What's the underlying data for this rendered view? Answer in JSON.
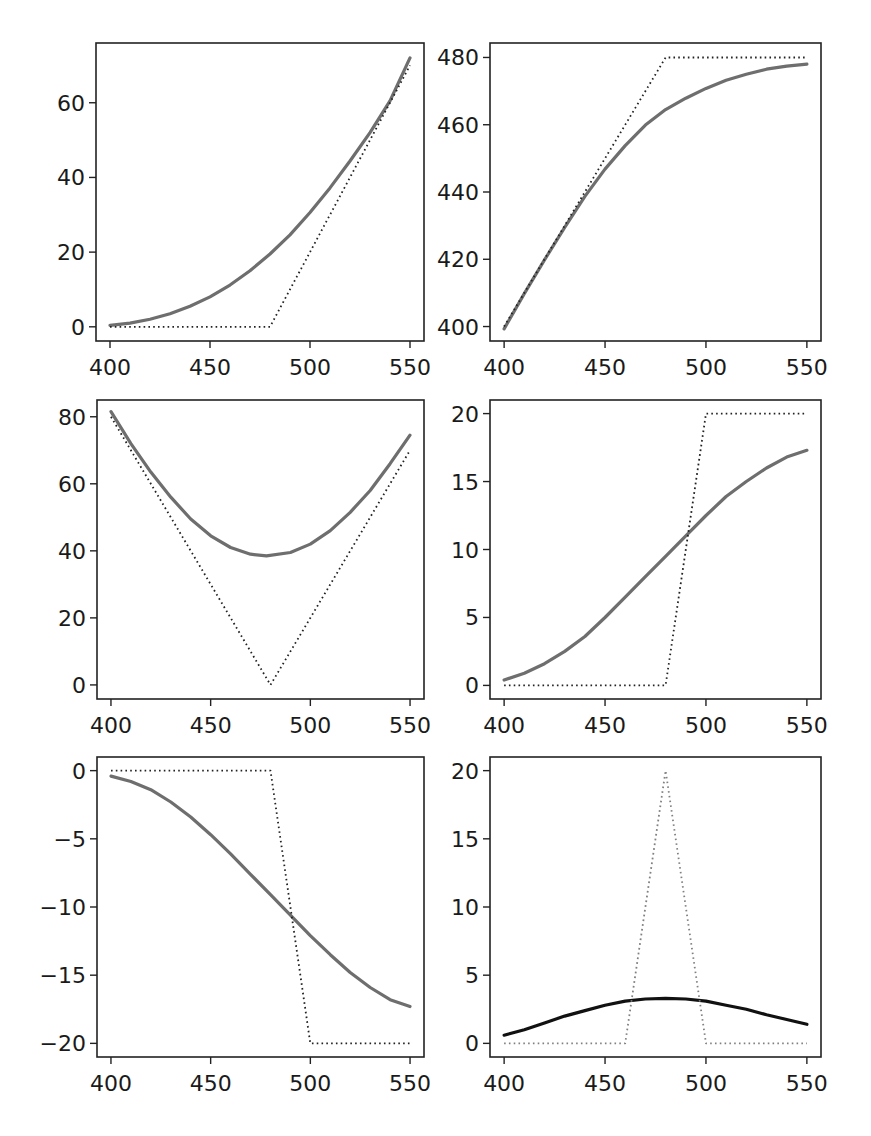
{
  "figure": {
    "layout": "3 rows x 2 columns grid of line plots",
    "colors": {
      "solid_gray": "#6e6e6e",
      "solid_black": "#111111",
      "dotted_black": "#222222",
      "dotted_gray": "#808080",
      "frame": "#222222",
      "background": "#ffffff"
    }
  },
  "chart_data": [
    {
      "id": "panel-1",
      "type": "line",
      "title": "",
      "xlabel": "",
      "ylabel": "",
      "xlim": [
        393,
        557
      ],
      "ylim": [
        -3.8,
        76
      ],
      "xticks": [
        400,
        450,
        500,
        550
      ],
      "xtick_labels": [
        "400",
        "450",
        "500",
        "550"
      ],
      "yticks": [
        0,
        20,
        40,
        60
      ],
      "ytick_labels": [
        "0",
        "20",
        "40",
        "60"
      ],
      "grid": false,
      "box": {
        "left": 96,
        "top": 43,
        "right": 424,
        "bottom": 341
      },
      "series": [
        {
          "name": "smoothed",
          "style": "solid",
          "color": "#6e6e6e",
          "width": 3.2,
          "x": [
            400,
            410,
            420,
            430,
            440,
            450,
            460,
            470,
            480,
            490,
            500,
            510,
            520,
            530,
            540,
            550
          ],
          "y": [
            0.4,
            1.0,
            2.0,
            3.5,
            5.5,
            8.0,
            11.2,
            15.0,
            19.5,
            24.6,
            30.6,
            37.2,
            44.4,
            52.0,
            60.5,
            72.0
          ]
        },
        {
          "name": "piecewise",
          "style": "dotted",
          "color": "#222222",
          "width": 1.8,
          "x": [
            400,
            480,
            550
          ],
          "y": [
            0,
            0,
            70
          ]
        }
      ]
    },
    {
      "id": "panel-2",
      "type": "line",
      "title": "",
      "xlabel": "",
      "ylabel": "",
      "xlim": [
        393,
        557
      ],
      "ylim": [
        395.7,
        484.3
      ],
      "xticks": [
        400,
        450,
        500,
        550
      ],
      "xtick_labels": [
        "400",
        "450",
        "500",
        "550"
      ],
      "yticks": [
        400,
        420,
        440,
        460,
        480
      ],
      "ytick_labels": [
        "400",
        "420",
        "440",
        "460",
        "480"
      ],
      "grid": false,
      "box": {
        "left": 490,
        "top": 43,
        "right": 821,
        "bottom": 341
      },
      "series": [
        {
          "name": "smoothed",
          "style": "solid",
          "color": "#6e6e6e",
          "width": 3.2,
          "x": [
            400,
            410,
            420,
            430,
            440,
            450,
            460,
            470,
            480,
            490,
            500,
            510,
            520,
            530,
            540,
            550
          ],
          "y": [
            399.3,
            409.8,
            419.8,
            429.5,
            438.7,
            446.8,
            453.8,
            459.9,
            464.5,
            467.9,
            470.8,
            473.2,
            475.0,
            476.5,
            477.4,
            478.0
          ]
        },
        {
          "name": "piecewise",
          "style": "dotted",
          "color": "#222222",
          "width": 1.8,
          "x": [
            400,
            480,
            550
          ],
          "y": [
            400,
            480,
            480
          ]
        }
      ]
    },
    {
      "id": "panel-3",
      "type": "line",
      "title": "",
      "xlabel": "",
      "ylabel": "",
      "xlim": [
        393,
        557
      ],
      "ylim": [
        -4.2,
        85
      ],
      "xticks": [
        400,
        450,
        500,
        550
      ],
      "xtick_labels": [
        "400",
        "450",
        "500",
        "550"
      ],
      "yticks": [
        0,
        20,
        40,
        60,
        80
      ],
      "ytick_labels": [
        "0",
        "20",
        "40",
        "60",
        "80"
      ],
      "grid": false,
      "box": {
        "left": 97,
        "top": 400,
        "right": 424,
        "bottom": 699
      },
      "series": [
        {
          "name": "smoothed",
          "style": "solid",
          "color": "#6e6e6e",
          "width": 3.2,
          "x": [
            400,
            410,
            420,
            430,
            440,
            450,
            460,
            470,
            478,
            490,
            500,
            510,
            520,
            530,
            540,
            550
          ],
          "y": [
            81.5,
            72.0,
            63.5,
            56.0,
            49.5,
            44.5,
            41.0,
            39.0,
            38.5,
            39.5,
            42.0,
            46.0,
            51.5,
            58.0,
            66.0,
            74.5
          ]
        },
        {
          "name": "piecewise",
          "style": "dotted",
          "color": "#222222",
          "width": 1.8,
          "x": [
            400,
            480,
            550
          ],
          "y": [
            80,
            0,
            70
          ]
        }
      ]
    },
    {
      "id": "panel-4",
      "type": "line",
      "title": "",
      "xlabel": "",
      "ylabel": "",
      "xlim": [
        393,
        557
      ],
      "ylim": [
        -1.0,
        21.0
      ],
      "xticks": [
        400,
        450,
        500,
        550
      ],
      "xtick_labels": [
        "400",
        "450",
        "500",
        "550"
      ],
      "yticks": [
        0,
        5,
        10,
        15,
        20
      ],
      "ytick_labels": [
        "0",
        "5",
        "10",
        "15",
        "20"
      ],
      "grid": false,
      "box": {
        "left": 490,
        "top": 400,
        "right": 821,
        "bottom": 699
      },
      "series": [
        {
          "name": "smoothed",
          "style": "solid",
          "color": "#6e6e6e",
          "width": 3.2,
          "x": [
            400,
            410,
            420,
            430,
            440,
            450,
            460,
            470,
            480,
            490,
            500,
            510,
            520,
            530,
            540,
            550
          ],
          "y": [
            0.4,
            0.9,
            1.6,
            2.5,
            3.6,
            5.0,
            6.5,
            8.0,
            9.5,
            11.0,
            12.5,
            13.9,
            15.0,
            16.0,
            16.8,
            17.3
          ]
        },
        {
          "name": "piecewise",
          "style": "dotted",
          "color": "#222222",
          "width": 1.8,
          "x": [
            400,
            480,
            500,
            550
          ],
          "y": [
            0,
            0,
            20,
            20
          ]
        }
      ]
    },
    {
      "id": "panel-5",
      "type": "line",
      "title": "",
      "xlabel": "",
      "ylabel": "",
      "xlim": [
        393,
        557
      ],
      "ylim": [
        -21.0,
        1.0
      ],
      "xticks": [
        400,
        450,
        500,
        550
      ],
      "xtick_labels": [
        "400",
        "450",
        "500",
        "550"
      ],
      "yticks": [
        0,
        -5,
        -10,
        -15,
        -20
      ],
      "ytick_labels": [
        "0",
        "−5",
        "−10",
        "−15",
        "−20"
      ],
      "grid": false,
      "box": {
        "left": 97,
        "top": 757,
        "right": 424,
        "bottom": 1057
      },
      "series": [
        {
          "name": "smoothed",
          "style": "solid",
          "color": "#6e6e6e",
          "width": 3.2,
          "x": [
            400,
            410,
            420,
            430,
            440,
            450,
            460,
            470,
            480,
            490,
            500,
            510,
            520,
            530,
            540,
            550
          ],
          "y": [
            -0.4,
            -0.8,
            -1.4,
            -2.3,
            -3.4,
            -4.7,
            -6.1,
            -7.6,
            -9.1,
            -10.6,
            -12.1,
            -13.5,
            -14.8,
            -15.9,
            -16.8,
            -17.3
          ]
        },
        {
          "name": "piecewise",
          "style": "dotted",
          "color": "#222222",
          "width": 1.8,
          "x": [
            400,
            480,
            500,
            550
          ],
          "y": [
            0,
            0,
            -20,
            -20
          ]
        }
      ]
    },
    {
      "id": "panel-6",
      "type": "line",
      "title": "",
      "xlabel": "",
      "ylabel": "",
      "xlim": [
        393,
        557
      ],
      "ylim": [
        -1.0,
        21.0
      ],
      "xticks": [
        400,
        450,
        500,
        550
      ],
      "xtick_labels": [
        "400",
        "450",
        "500",
        "550"
      ],
      "yticks": [
        0,
        5,
        10,
        15,
        20
      ],
      "ytick_labels": [
        "0",
        "5",
        "10",
        "15",
        "20"
      ],
      "grid": false,
      "box": {
        "left": 490,
        "top": 757,
        "right": 821,
        "bottom": 1057
      },
      "series": [
        {
          "name": "smoothed",
          "style": "solid",
          "color": "#111111",
          "width": 3.2,
          "x": [
            400,
            410,
            420,
            430,
            440,
            450,
            460,
            470,
            480,
            490,
            500,
            510,
            520,
            530,
            540,
            550
          ],
          "y": [
            0.6,
            1.0,
            1.5,
            2.0,
            2.4,
            2.8,
            3.1,
            3.25,
            3.3,
            3.25,
            3.1,
            2.8,
            2.5,
            2.1,
            1.75,
            1.4
          ]
        },
        {
          "name": "triangle",
          "style": "dotted",
          "color": "#808080",
          "width": 1.8,
          "x": [
            400,
            460,
            480,
            500,
            550
          ],
          "y": [
            0,
            0,
            20,
            0,
            0
          ]
        }
      ]
    }
  ]
}
